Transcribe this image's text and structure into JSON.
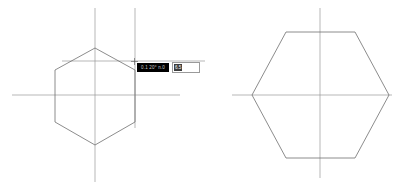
{
  "app": {
    "title": "CAD Drafting Canvas",
    "background_color": "#ffffff",
    "geometry_color": "#6e6e6e",
    "centerline_color": "#9a9a9a",
    "width": 405,
    "height": 190
  },
  "left_view": {
    "name": "Hexagon in progress",
    "shape_label": "hexagon",
    "vertical_centerline": {
      "x": 95,
      "y1": 8,
      "y2": 182
    },
    "horizontal_centerline": {
      "y": 95,
      "x1": 12,
      "x2": 180
    },
    "construction_vertical": {
      "x": 135,
      "y1": 8,
      "y2": 128
    },
    "construction_horizontal": {
      "y": 61,
      "x1": 62,
      "x2": 205
    },
    "hexagon_points": "95,48 135,70 135,122 95,145 55,122 55,70"
  },
  "right_view": {
    "name": "Hexagon completed",
    "shape_label": "hexagon",
    "vertical_centerline": {
      "x": 320,
      "y": 8,
      "y2": 178
    },
    "horizontal_centerline": {
      "y": 95,
      "x1": 232,
      "x2": 392
    },
    "hexagon_points": "286,32 355,32 389,95 355,158 286,158 252,95"
  },
  "tooltip": {
    "dimension_text": "0.1 20° n.0",
    "separator": "",
    "input_value": "6.5",
    "input_placeholder": "6.5"
  },
  "cursor": {
    "icon": "crosshair-cursor",
    "x": 134,
    "y": 61
  }
}
